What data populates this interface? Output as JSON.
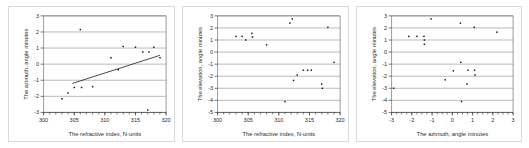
{
  "figure": {
    "panel_count": 3,
    "background_color": "#ffffff",
    "border_color": "#d9d9d9",
    "marker_color": "#1a1a1a",
    "gridline_color": "#8c8c8c",
    "axis_color": "#3a3a3a"
  },
  "chart_data": [
    {
      "type": "scatter",
      "title": "",
      "xlabel": "The refractive index, N-units",
      "ylabel": "The azimuth, angle minutes",
      "xlim": [
        300,
        320
      ],
      "ylim": [
        -3,
        3
      ],
      "xticks": [
        300,
        305,
        310,
        315,
        320
      ],
      "xtick_labels": [
        "300",
        "305",
        "310",
        "315",
        "320"
      ],
      "xminor_step": 1,
      "yticks": [
        -3,
        -2,
        -1,
        0,
        1,
        2,
        3
      ],
      "ytick_labels": [
        "-3",
        "-2",
        "-1",
        "0",
        "1",
        "2",
        "3"
      ],
      "grid": "horizontal",
      "legend": "none",
      "points": [
        {
          "x": 303.0,
          "y": -2.15
        },
        {
          "x": 304.0,
          "y": -1.8
        },
        {
          "x": 305.0,
          "y": -1.45
        },
        {
          "x": 306.0,
          "y": 2.15
        },
        {
          "x": 306.2,
          "y": -1.45
        },
        {
          "x": 308.0,
          "y": -1.4
        },
        {
          "x": 311.0,
          "y": 0.4
        },
        {
          "x": 312.2,
          "y": -0.35
        },
        {
          "x": 313.0,
          "y": 1.1
        },
        {
          "x": 315.0,
          "y": 1.05
        },
        {
          "x": 316.2,
          "y": 0.75
        },
        {
          "x": 317.0,
          "y": -2.85
        },
        {
          "x": 317.2,
          "y": 0.75
        },
        {
          "x": 318.0,
          "y": 1.05
        },
        {
          "x": 319.0,
          "y": 0.4
        }
      ],
      "trendline": {
        "x0": 304.7,
        "y0": -1.2,
        "x1": 319.0,
        "y1": 0.55
      }
    },
    {
      "type": "scatter",
      "title": "",
      "xlabel": "The refractive index, N-units",
      "ylabel": "The elevation, angle minutes",
      "xlim": [
        300,
        320
      ],
      "ylim": [
        -5,
        3
      ],
      "xticks": [
        300,
        305,
        310,
        315,
        320
      ],
      "xtick_labels": [
        "300",
        "305",
        "310",
        "315",
        "320"
      ],
      "xminor_step": 1,
      "yticks": [
        -5,
        -4,
        -3,
        -2,
        -1,
        0,
        1,
        2,
        3
      ],
      "ytick_labels": [
        "-5",
        "-4",
        "-3",
        "-2",
        "-1",
        "0",
        "1",
        "2",
        "3"
      ],
      "grid": "horizontal",
      "legend": "none",
      "points": [
        {
          "x": 303.0,
          "y": 1.3
        },
        {
          "x": 304.0,
          "y": 1.3
        },
        {
          "x": 304.6,
          "y": 1.0
        },
        {
          "x": 305.6,
          "y": 1.55
        },
        {
          "x": 305.7,
          "y": 1.25
        },
        {
          "x": 308.0,
          "y": 0.6
        },
        {
          "x": 311.0,
          "y": -4.1
        },
        {
          "x": 311.8,
          "y": 2.4
        },
        {
          "x": 312.2,
          "y": 2.75
        },
        {
          "x": 312.4,
          "y": -2.35
        },
        {
          "x": 313.0,
          "y": -1.9
        },
        {
          "x": 314.0,
          "y": -1.5
        },
        {
          "x": 314.7,
          "y": -1.5
        },
        {
          "x": 315.3,
          "y": -1.5
        },
        {
          "x": 317.0,
          "y": -2.65
        },
        {
          "x": 317.1,
          "y": -3.0
        },
        {
          "x": 318.0,
          "y": 2.05
        },
        {
          "x": 319.0,
          "y": -0.85
        }
      ],
      "trendline": null
    },
    {
      "type": "scatter",
      "title": "",
      "xlabel": "The azimuth, angle minutes",
      "ylabel": "The elevation, angle minutes",
      "xlim": [
        -3,
        3
      ],
      "ylim": [
        -5,
        3
      ],
      "xticks": [
        -3,
        -2,
        -1,
        0,
        1,
        2,
        3
      ],
      "xtick_labels": [
        "-3",
        "-2",
        "-1",
        "0",
        "1",
        "2",
        "3"
      ],
      "xminor_step": 0.25,
      "yticks": [
        -5,
        -4,
        -3,
        -2,
        -1,
        0,
        1,
        2,
        3
      ],
      "ytick_labels": [
        "-5",
        "-4",
        "-3",
        "-2",
        "-1",
        "0",
        "1",
        "2",
        "3"
      ],
      "grid": "horizontal",
      "legend": "none",
      "points": [
        {
          "x": -2.9,
          "y": -3.0
        },
        {
          "x": -2.15,
          "y": 1.3
        },
        {
          "x": -1.75,
          "y": 1.3
        },
        {
          "x": -1.4,
          "y": 1.3
        },
        {
          "x": -1.38,
          "y": 1.0
        },
        {
          "x": -1.38,
          "y": 0.65
        },
        {
          "x": -1.05,
          "y": 2.75
        },
        {
          "x": -0.35,
          "y": -2.3
        },
        {
          "x": 0.05,
          "y": -1.55
        },
        {
          "x": 0.4,
          "y": 2.4
        },
        {
          "x": 0.42,
          "y": -0.85
        },
        {
          "x": 0.45,
          "y": -4.1
        },
        {
          "x": 0.72,
          "y": -2.65
        },
        {
          "x": 0.78,
          "y": -1.5
        },
        {
          "x": 1.08,
          "y": 2.05
        },
        {
          "x": 1.1,
          "y": -1.5
        },
        {
          "x": 1.12,
          "y": -1.9
        },
        {
          "x": 2.2,
          "y": 1.65
        }
      ],
      "trendline": null
    }
  ]
}
